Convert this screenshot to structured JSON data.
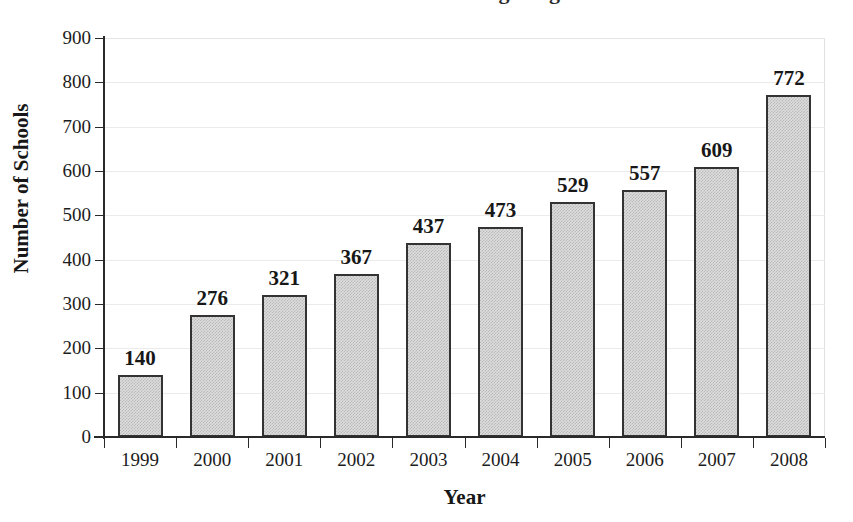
{
  "chart_data": {
    "type": "bar",
    "title": "",
    "xlabel": "Year",
    "ylabel": "Number of Schools",
    "categories": [
      "1999",
      "2000",
      "2001",
      "2002",
      "2003",
      "2004",
      "2005",
      "2006",
      "2007",
      "2008"
    ],
    "values": [
      140,
      276,
      321,
      367,
      437,
      473,
      529,
      557,
      609,
      772
    ],
    "value_labels": [
      "140",
      "276",
      "321",
      "367",
      "437",
      "473",
      "529",
      "557",
      "609",
      "772"
    ],
    "ylim": [
      0,
      900
    ],
    "ytick_values": [
      0,
      100,
      200,
      300,
      400,
      500,
      600,
      700,
      800,
      900
    ],
    "ytick_labels": [
      "0",
      "100",
      "200",
      "300",
      "400",
      "500",
      "600",
      "700",
      "800",
      "900"
    ],
    "grid": "horizontal",
    "legend": "none",
    "bar_fill_color": "#dddddd",
    "bar_border_color": "#333333",
    "gridline_color": "#ebebeb",
    "axis_color": "#2a2a2a",
    "background_color": "#ffffff"
  },
  "title_remnant": {
    "text": "Number of Schools Offering Programs"
  }
}
